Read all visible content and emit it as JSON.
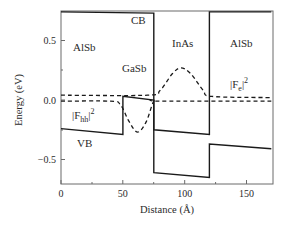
{
  "chart_data": {
    "type": "line",
    "title": "",
    "xlabel": "Distance (Å)",
    "ylabel": "Energy (eV)",
    "xlim": [
      0,
      170
    ],
    "ylim": [
      -0.71,
      0.74
    ],
    "grid": false,
    "x_ticks": [
      0,
      50,
      100,
      150
    ],
    "x_tick_labels": [
      "0",
      "50",
      "100",
      "150"
    ],
    "y_ticks": [
      0.5,
      0.0,
      -0.5
    ],
    "y_tick_labels": [
      "0.5",
      "0.0",
      "−0.5"
    ],
    "regions": [
      {
        "name": "AlSb",
        "x_range": [
          0,
          50
        ]
      },
      {
        "name": "GaSb",
        "x_range": [
          50,
          75
        ]
      },
      {
        "name": "InAs",
        "x_range": [
          75,
          120
        ]
      },
      {
        "name": "AlSb",
        "x_range": [
          120,
          170
        ]
      }
    ],
    "series": [
      {
        "name": "CB",
        "style": "solid",
        "points": [
          [
            0,
            0.74
          ],
          [
            75,
            0.73
          ],
          [
            75,
            -0.25
          ],
          [
            120,
            -0.29
          ],
          [
            120,
            0.74
          ],
          [
            170,
            0.74
          ]
        ]
      },
      {
        "name": "VB",
        "style": "solid",
        "points": [
          [
            0,
            -0.24
          ],
          [
            50,
            -0.29
          ],
          [
            50,
            0.03
          ],
          [
            75,
            0.0
          ],
          [
            75,
            -0.61
          ],
          [
            120,
            -0.65
          ],
          [
            120,
            -0.37
          ],
          [
            170,
            -0.41
          ]
        ]
      },
      {
        "name": "|F_e|^2",
        "style": "dashed",
        "points": [
          [
            0,
            0.04
          ],
          [
            70,
            0.04
          ],
          [
            80,
            0.08
          ],
          [
            90,
            0.22
          ],
          [
            97,
            0.27
          ],
          [
            105,
            0.22
          ],
          [
            115,
            0.08
          ],
          [
            122,
            0.03
          ],
          [
            170,
            0.02
          ]
        ]
      },
      {
        "name": "|F_hh|^2",
        "style": "dashed",
        "points": [
          [
            0,
            -0.01
          ],
          [
            40,
            -0.01
          ],
          [
            48,
            -0.04
          ],
          [
            55,
            -0.18
          ],
          [
            62,
            -0.27
          ],
          [
            69,
            -0.18
          ],
          [
            75,
            -0.01
          ],
          [
            80,
            -0.01
          ],
          [
            170,
            -0.01
          ]
        ]
      }
    ],
    "annotations": [
      {
        "text": "AlSb",
        "x": 20,
        "y": 0.4
      },
      {
        "text": "CB",
        "x": 67,
        "y": 0.65
      },
      {
        "text": "GaSb",
        "x": 60,
        "y": 0.26
      },
      {
        "text": "InAs",
        "x": 97,
        "y": 0.48
      },
      {
        "text": "AlSb",
        "x": 145,
        "y": 0.48
      },
      {
        "text": "|F_e|^2",
        "x": 140,
        "y": 0.13
      },
      {
        "text": "|F_hh|^2",
        "x": 10,
        "y": -0.14
      },
      {
        "text": "VB",
        "x": 14,
        "y": -0.36
      }
    ]
  },
  "labels": {
    "xlabel": "Distance (Å)",
    "ylabel": "Energy (eV)",
    "x_ticks": [
      "0",
      "50",
      "100",
      "150"
    ],
    "y_ticks": [
      "0.5",
      "0.0",
      "−0.5"
    ],
    "region_alsb_left": "AlSb",
    "region_cb": "CB",
    "region_gasb": "GaSb",
    "region_inas": "InAs",
    "region_alsb_right": "AlSb",
    "fe_base": "|F",
    "fe_sub": "e",
    "fe_tail": "|",
    "fe_sup": "2",
    "fhh_base": "|F",
    "fhh_sub": "hh",
    "fhh_tail": "|",
    "fhh_sup": "2",
    "vb": "VB"
  }
}
